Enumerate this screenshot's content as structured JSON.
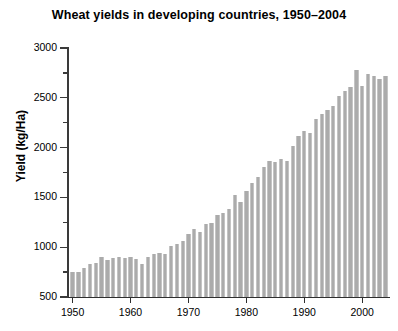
{
  "chart_data": {
    "type": "bar",
    "title": "Wheat yields in developing countries, 1950–2004",
    "xlabel": "",
    "ylabel": "Yield (kg/Ha)",
    "ylim": [
      500,
      3000
    ],
    "xlim": [
      1949.2,
      2004.8
    ],
    "grid": false,
    "legend": null,
    "bar_color": "#ababab",
    "axis_color": "#2e2e2e",
    "y_major_ticks": [
      500,
      1000,
      1500,
      2000,
      2500,
      3000
    ],
    "y_minor_ticks": [
      750,
      1250,
      1750,
      2250,
      2750
    ],
    "y_tick_labels": [
      "500",
      "1000",
      "1500",
      "2000",
      "2500",
      "3000"
    ],
    "x_major_ticks": [
      1950,
      1960,
      1970,
      1980,
      1990,
      2000
    ],
    "x_tick_labels": [
      "1950",
      "1960",
      "1970",
      "1980",
      "1990",
      "2000"
    ],
    "categories": [
      1950,
      1951,
      1952,
      1953,
      1954,
      1955,
      1956,
      1957,
      1958,
      1959,
      1960,
      1961,
      1962,
      1963,
      1964,
      1965,
      1966,
      1967,
      1968,
      1969,
      1970,
      1971,
      1972,
      1973,
      1974,
      1975,
      1976,
      1977,
      1978,
      1979,
      1980,
      1981,
      1982,
      1983,
      1984,
      1985,
      1986,
      1987,
      1988,
      1989,
      1990,
      1991,
      1992,
      1993,
      1994,
      1995,
      1996,
      1997,
      1998,
      1999,
      2000,
      2001,
      2002,
      2003,
      2004
    ],
    "values": [
      750,
      755,
      790,
      830,
      845,
      900,
      870,
      895,
      900,
      895,
      900,
      880,
      835,
      905,
      935,
      945,
      930,
      1010,
      1030,
      1065,
      1130,
      1180,
      1150,
      1230,
      1240,
      1320,
      1340,
      1385,
      1520,
      1450,
      1560,
      1640,
      1700,
      1810,
      1870,
      1860,
      1890,
      1870,
      2020,
      2120,
      2170,
      2150,
      2290,
      2340,
      2380,
      2420,
      2520,
      2570,
      2610,
      2780,
      2620,
      2740,
      2720,
      2690,
      2720
    ]
  }
}
